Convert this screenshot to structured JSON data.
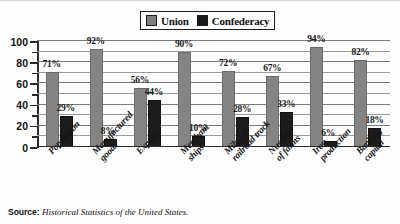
{
  "legend": {
    "items": [
      {
        "label": "Union",
        "color": "#848484",
        "icon": "square-swatch-icon"
      },
      {
        "label": "Confederacy",
        "color": "#1c1c1c",
        "icon": "square-swatch-icon"
      }
    ]
  },
  "source": {
    "label": "Source:",
    "text": "Historical Statistics of the United States."
  },
  "chart_data": {
    "type": "bar",
    "title": "",
    "subtitle": "",
    "xlabel": "",
    "ylabel": "",
    "ylim": [
      0,
      100
    ],
    "ytick_labels": [
      "0",
      "20",
      "40",
      "60",
      "80",
      "100"
    ],
    "ytick_values": [
      0,
      20,
      40,
      60,
      80,
      100
    ],
    "minor_tick_values": [
      10,
      30,
      50,
      70,
      90
    ],
    "grid": true,
    "grid_values": [
      10,
      20,
      30,
      40,
      50,
      60,
      70,
      80,
      90,
      100
    ],
    "legend_position": "top-center",
    "categories": [
      "Population",
      "Manufactured goods",
      "Exports",
      "Merchant ships",
      "Miles of railroad track",
      "Number of farms",
      "Iron production",
      "Banking capital"
    ],
    "category_lines": [
      [
        "Population"
      ],
      [
        "Manufactured",
        "goods"
      ],
      [
        "Exports"
      ],
      [
        "Merchant",
        "ships"
      ],
      [
        "Miles of",
        "railroad track"
      ],
      [
        "Number",
        "of farms"
      ],
      [
        "Iron",
        "production"
      ],
      [
        "Banking",
        "capital"
      ]
    ],
    "series": [
      {
        "name": "Union",
        "color": "#848484",
        "values": [
          71,
          92,
          56,
          90,
          72,
          67,
          94,
          82
        ],
        "labels": [
          "71%",
          "92%",
          "56%",
          "90%",
          "72%",
          "67%",
          "94%",
          "82%"
        ]
      },
      {
        "name": "Confederacy",
        "color": "#1c1c1c",
        "values": [
          29,
          8,
          44,
          10,
          28,
          33,
          6,
          18
        ],
        "labels": [
          "29%",
          "8%",
          "44%",
          "10%",
          "28%",
          "33%",
          "6%",
          "18%"
        ]
      }
    ]
  }
}
